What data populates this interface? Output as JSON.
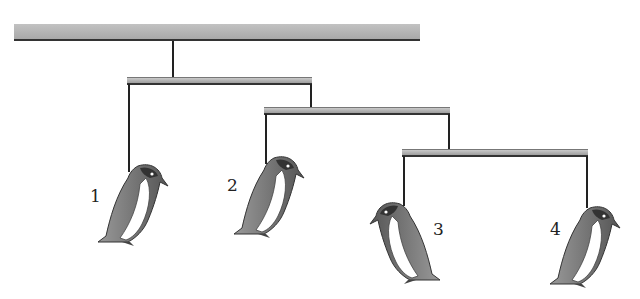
{
  "diagram": {
    "type": "mobile",
    "colors": {
      "bar": "#b8b8b8",
      "string": "#222222",
      "penguin_body": "#6e6e6e",
      "penguin_belly": "#ffffff"
    },
    "labels": [
      "1",
      "2",
      "3",
      "4"
    ]
  }
}
